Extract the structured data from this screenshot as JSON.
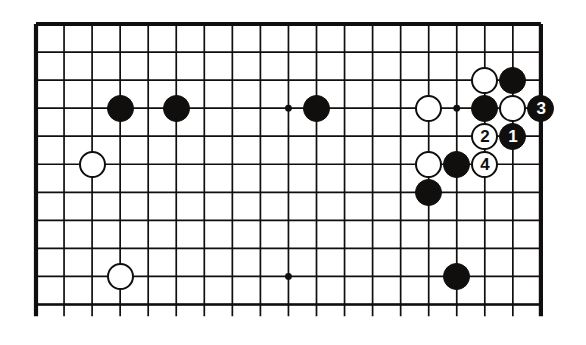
{
  "figure": {
    "kind": "go-board-diagram",
    "title": "",
    "board_columns_visible": 19,
    "board_rows_visible": 11,
    "colors": {
      "line": "#100f0d",
      "black_stone": "#100f0d",
      "white_stone": "#ffffff",
      "background": "#ffffff",
      "black_stone_label": "#ffffff",
      "white_stone_label": "#100f0d"
    },
    "geometry": {
      "origin_x": 36,
      "origin_y": 24,
      "spacing": 28.05,
      "cols": 19,
      "rows": 11,
      "stone_diameter": 27,
      "edge_top": true,
      "edge_right": true,
      "edge_left": true,
      "bottom_cut_off": true
    }
  },
  "hoshi_points": [
    {
      "name": "hoshi-upper-middle",
      "col": 9,
      "row": 3
    },
    {
      "name": "hoshi-upper-right",
      "col": 15,
      "row": 3
    },
    {
      "name": "hoshi-lower-middle",
      "col": 9,
      "row": 9
    }
  ],
  "stones": [
    {
      "name": "black-stone-c3r3",
      "color": "black",
      "col": 3,
      "row": 3,
      "label": ""
    },
    {
      "name": "black-stone-c5r3",
      "color": "black",
      "col": 5,
      "row": 3,
      "label": ""
    },
    {
      "name": "black-stone-c10r3",
      "color": "black",
      "col": 10,
      "row": 3,
      "label": ""
    },
    {
      "name": "white-stone-c2r5",
      "color": "white",
      "col": 2,
      "row": 5,
      "label": ""
    },
    {
      "name": "white-stone-c3r9",
      "color": "white",
      "col": 3,
      "row": 9,
      "label": ""
    },
    {
      "name": "white-stone-c14r3",
      "color": "white",
      "col": 14,
      "row": 3,
      "label": ""
    },
    {
      "name": "white-stone-c16r2",
      "color": "white",
      "col": 16,
      "row": 2,
      "label": ""
    },
    {
      "name": "black-stone-c17r2",
      "color": "black",
      "col": 17,
      "row": 2,
      "label": ""
    },
    {
      "name": "black-stone-c16r3",
      "color": "black",
      "col": 16,
      "row": 3,
      "label": ""
    },
    {
      "name": "white-stone-c17r3",
      "color": "white",
      "col": 17,
      "row": 3,
      "label": ""
    },
    {
      "name": "black-stone-move-3",
      "color": "black",
      "col": 18,
      "row": 3,
      "label": "3"
    },
    {
      "name": "white-stone-move-2",
      "color": "white",
      "col": 16,
      "row": 4,
      "label": "2"
    },
    {
      "name": "black-stone-move-1",
      "color": "black",
      "col": 17,
      "row": 4,
      "label": "1"
    },
    {
      "name": "white-stone-c14r5",
      "color": "white",
      "col": 14,
      "row": 5,
      "label": ""
    },
    {
      "name": "black-stone-c15r5",
      "color": "black",
      "col": 15,
      "row": 5,
      "label": ""
    },
    {
      "name": "white-stone-move-4",
      "color": "white",
      "col": 16,
      "row": 5,
      "label": "4"
    },
    {
      "name": "black-stone-c14r6",
      "color": "black",
      "col": 14,
      "row": 6,
      "label": ""
    },
    {
      "name": "black-stone-c15r9",
      "color": "black",
      "col": 15,
      "row": 9,
      "label": ""
    }
  ]
}
